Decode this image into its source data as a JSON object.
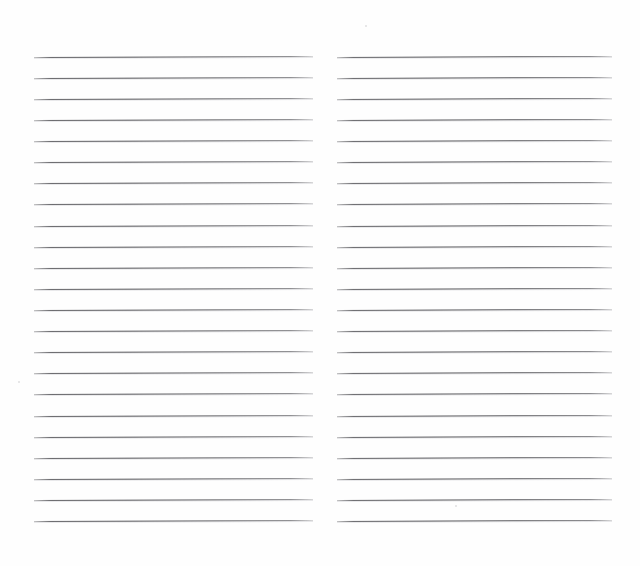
{
  "document": {
    "title": "Blank ruled notebook page",
    "type": "scanned-ruled-paper",
    "page_width": 640,
    "page_height": 566,
    "background_color": "#ffffff",
    "paper_color": "#fefefe",
    "rule_color": "#4e4e52",
    "rule_secondary_color": "#b4b4b8",
    "content_text": "",
    "visible_text": "none"
  },
  "layout": {
    "columns": 2,
    "lines_per_column": 23,
    "first_line_y": 57,
    "line_spacing": 21.1,
    "line_thickness": 1,
    "line_slant_deg": -0.22,
    "gutter_start_x": 313,
    "gutter_end_x": 337,
    "top_margin": 57,
    "bottom_margin": 45
  },
  "columns": [
    {
      "name": "left-column",
      "x": 34,
      "width": 279,
      "lines": [
        {
          "index": 1,
          "y": 57
        },
        {
          "index": 2,
          "y": 78
        },
        {
          "index": 3,
          "y": 99
        },
        {
          "index": 4,
          "y": 120
        },
        {
          "index": 5,
          "y": 141
        },
        {
          "index": 6,
          "y": 162
        },
        {
          "index": 7,
          "y": 183
        },
        {
          "index": 8,
          "y": 204
        },
        {
          "index": 9,
          "y": 226
        },
        {
          "index": 10,
          "y": 247
        },
        {
          "index": 11,
          "y": 268
        },
        {
          "index": 12,
          "y": 289
        },
        {
          "index": 13,
          "y": 310
        },
        {
          "index": 14,
          "y": 331
        },
        {
          "index": 15,
          "y": 352
        },
        {
          "index": 16,
          "y": 373
        },
        {
          "index": 17,
          "y": 394
        },
        {
          "index": 18,
          "y": 416
        },
        {
          "index": 19,
          "y": 437
        },
        {
          "index": 20,
          "y": 458
        },
        {
          "index": 21,
          "y": 479
        },
        {
          "index": 22,
          "y": 500
        },
        {
          "index": 23,
          "y": 521
        }
      ]
    },
    {
      "name": "right-column",
      "x": 337,
      "width": 275,
      "lines": [
        {
          "index": 1,
          "y": 57
        },
        {
          "index": 2,
          "y": 78
        },
        {
          "index": 3,
          "y": 99
        },
        {
          "index": 4,
          "y": 120
        },
        {
          "index": 5,
          "y": 141
        },
        {
          "index": 6,
          "y": 162
        },
        {
          "index": 7,
          "y": 183
        },
        {
          "index": 8,
          "y": 204
        },
        {
          "index": 9,
          "y": 226
        },
        {
          "index": 10,
          "y": 247
        },
        {
          "index": 11,
          "y": 268
        },
        {
          "index": 12,
          "y": 289
        },
        {
          "index": 13,
          "y": 310
        },
        {
          "index": 14,
          "y": 331
        },
        {
          "index": 15,
          "y": 352
        },
        {
          "index": 16,
          "y": 373
        },
        {
          "index": 17,
          "y": 394
        },
        {
          "index": 18,
          "y": 416
        },
        {
          "index": 19,
          "y": 437
        },
        {
          "index": 20,
          "y": 458
        },
        {
          "index": 21,
          "y": 479
        },
        {
          "index": 22,
          "y": 500
        },
        {
          "index": 23,
          "y": 521
        }
      ]
    }
  ],
  "specks": [
    {
      "x": 365,
      "y": 25
    },
    {
      "x": 18,
      "y": 381
    },
    {
      "x": 455,
      "y": 505
    }
  ]
}
